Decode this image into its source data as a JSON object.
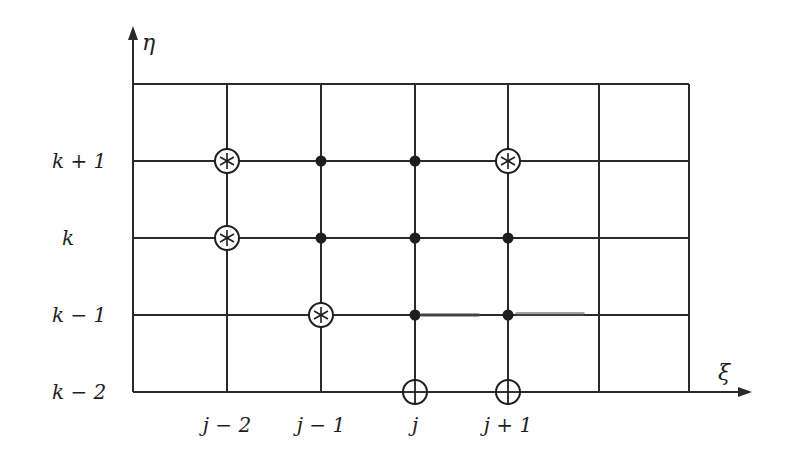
{
  "diagram": {
    "type": "finite-difference stencil grid",
    "axes": {
      "x_label": "ξ",
      "y_label": "η"
    },
    "grid": {
      "x_lines": [
        133,
        227,
        321,
        415,
        508,
        599,
        689
      ],
      "y_lines": [
        84,
        161,
        238,
        315,
        392
      ],
      "line_color": "#2a2a2a"
    },
    "row_labels": [
      {
        "text": "k + 1",
        "y": 161
      },
      {
        "text": "k",
        "y": 238
      },
      {
        "text": "k − 1",
        "y": 315
      },
      {
        "text": "k − 2",
        "y": 392
      }
    ],
    "column_labels": [
      {
        "text": "j − 2",
        "x": 227
      },
      {
        "text": "j − 1",
        "x": 321
      },
      {
        "text": "j",
        "x": 415
      },
      {
        "text": "j + 1",
        "x": 508
      }
    ],
    "markers": {
      "filled_dots": [
        {
          "col": "j-1",
          "row": "k+1",
          "x": 321,
          "y": 161
        },
        {
          "col": "j",
          "row": "k+1",
          "x": 415,
          "y": 161
        },
        {
          "col": "j-1",
          "row": "k",
          "x": 321,
          "y": 238
        },
        {
          "col": "j",
          "row": "k",
          "x": 415,
          "y": 238
        },
        {
          "col": "j+1",
          "row": "k",
          "x": 508,
          "y": 238
        },
        {
          "col": "j",
          "row": "k-1",
          "x": 415,
          "y": 315
        },
        {
          "col": "j+1",
          "row": "k-1",
          "x": 508,
          "y": 315
        }
      ],
      "circled_asterisks": [
        {
          "col": "j-2",
          "row": "k+1",
          "x": 227,
          "y": 161
        },
        {
          "col": "j+1",
          "row": "k+1",
          "x": 508,
          "y": 161
        },
        {
          "col": "j-2",
          "row": "k",
          "x": 227,
          "y": 238
        },
        {
          "col": "j-1",
          "row": "k-1",
          "x": 321,
          "y": 315
        }
      ],
      "circled_plus": [
        {
          "col": "j",
          "row": "k-2",
          "x": 415,
          "y": 392
        },
        {
          "col": "j+1",
          "row": "k-2",
          "x": 508,
          "y": 392
        }
      ]
    }
  }
}
